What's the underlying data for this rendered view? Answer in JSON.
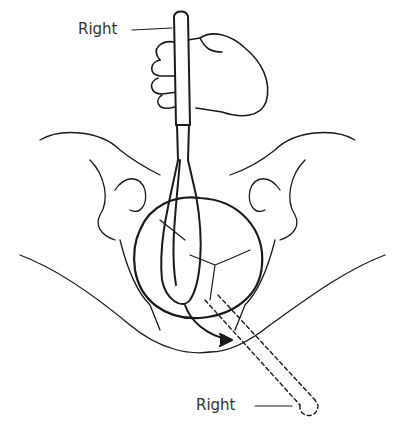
{
  "diagram": {
    "labels": {
      "top": "Right",
      "bottom": "Right"
    },
    "colors": {
      "line": "#1a1a1a",
      "background": "#ffffff"
    }
  }
}
